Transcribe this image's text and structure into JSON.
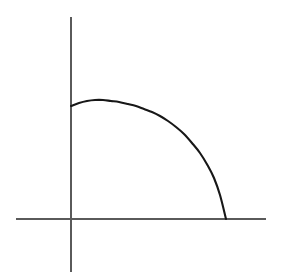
{
  "figure": {
    "title": "",
    "background_color": "#ffffff",
    "width": 282,
    "height": 276
  },
  "axes": {
    "x_axis": {
      "name": "horizontal-axis",
      "label": "",
      "color": "#5a5a5a",
      "stroke_width": 1.2,
      "x_start": 16,
      "x_end": 266,
      "y": 219
    },
    "y_axis": {
      "name": "vertical-axis",
      "label": "",
      "color": "#5a5a5a",
      "stroke_width": 1.2,
      "x": 71,
      "y_start": 17,
      "y_end": 272
    },
    "origin": {
      "x": 71,
      "y": 219
    },
    "ticks": [],
    "tick_labels": []
  },
  "chart_data": {
    "type": "line",
    "title": "",
    "xlabel": "",
    "ylabel": "",
    "grid": false,
    "legend": null,
    "curve_color": "#171717",
    "curve_stroke_width": 2.1,
    "axis_ranges": {
      "xlim": [
        0,
        1
      ],
      "ylim": [
        0,
        1
      ]
    },
    "x": [
      0.0,
      0.05,
      0.1,
      0.15,
      0.2,
      0.25,
      0.3,
      0.35,
      0.4,
      0.45,
      0.5,
      0.55,
      0.6,
      0.65,
      0.7,
      0.75,
      0.8,
      0.85,
      0.9,
      0.95,
      1.0
    ],
    "values": [
      0.956,
      0.981,
      0.995,
      1.0,
      0.997,
      0.987,
      0.969,
      0.945,
      0.914,
      0.876,
      0.831,
      0.779,
      0.718,
      0.649,
      0.57,
      0.48,
      0.377,
      0.258,
      0.163,
      0.082,
      0.0
    ],
    "pixel_points": [
      {
        "x": 71,
        "y": 106
      },
      {
        "x": 79,
        "y": 103
      },
      {
        "x": 87,
        "y": 101
      },
      {
        "x": 95,
        "y": 100
      },
      {
        "x": 103,
        "y": 100
      },
      {
        "x": 111,
        "y": 101
      },
      {
        "x": 119,
        "y": 102
      },
      {
        "x": 128,
        "y": 104
      },
      {
        "x": 136,
        "y": 106
      },
      {
        "x": 144,
        "y": 109
      },
      {
        "x": 152,
        "y": 112
      },
      {
        "x": 160,
        "y": 116
      },
      {
        "x": 168,
        "y": 121
      },
      {
        "x": 176,
        "y": 127
      },
      {
        "x": 184,
        "y": 134
      },
      {
        "x": 192,
        "y": 143
      },
      {
        "x": 200,
        "y": 153
      },
      {
        "x": 208,
        "y": 166
      },
      {
        "x": 214,
        "y": 178
      },
      {
        "x": 220,
        "y": 195
      },
      {
        "x": 226,
        "y": 219
      }
    ],
    "endpoints": {
      "start_on_y_axis": {
        "x": 71,
        "y": 106
      },
      "apex": {
        "x": 103,
        "y": 100
      },
      "end_on_x_axis": {
        "x": 226,
        "y": 219
      }
    }
  }
}
